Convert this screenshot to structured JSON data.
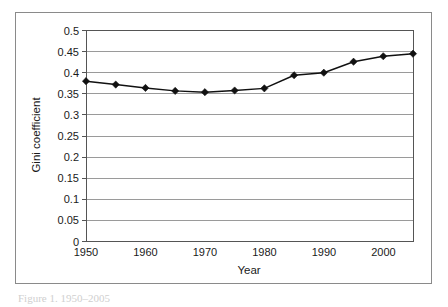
{
  "figure": {
    "caption_fragment": "Figure 1.  1950–2005"
  },
  "chart_data": {
    "type": "line",
    "title": "",
    "subtitle": "",
    "xlabel": "Year",
    "ylabel": "Gini coefficient",
    "x": [
      1950,
      1955,
      1960,
      1965,
      1970,
      1975,
      1980,
      1985,
      1990,
      1995,
      2000,
      2005
    ],
    "values": [
      0.379,
      0.371,
      0.363,
      0.356,
      0.353,
      0.357,
      0.362,
      0.393,
      0.399,
      0.425,
      0.438,
      0.444
    ],
    "series": [
      {
        "name": "Gini coefficient",
        "values": [
          0.379,
          0.371,
          0.363,
          0.356,
          0.353,
          0.357,
          0.362,
          0.393,
          0.399,
          0.425,
          0.438,
          0.444
        ]
      }
    ],
    "xlim": [
      1950,
      2005
    ],
    "ylim": [
      0,
      0.5
    ],
    "x_tick_labels": [
      "1950",
      "1960",
      "1970",
      "1980",
      "1990",
      "2000"
    ],
    "x_tick_values": [
      1950,
      1960,
      1970,
      1980,
      1990,
      2000
    ],
    "y_tick_labels": [
      "0",
      "0.05",
      "0.1",
      "0.15",
      "0.2",
      "0.25",
      "0.3",
      "0.35",
      "0.4",
      "0.45",
      "0.5"
    ],
    "y_tick_values": [
      0,
      0.05,
      0.1,
      0.15,
      0.2,
      0.25,
      0.3,
      0.35,
      0.4,
      0.45,
      0.5
    ],
    "grid": "horizontal",
    "legend": "none",
    "marker": "diamond",
    "line_color": "#111111",
    "grid_color": "#9a9a9a",
    "axis_color": "#555555",
    "background_color": "#ffffff"
  }
}
